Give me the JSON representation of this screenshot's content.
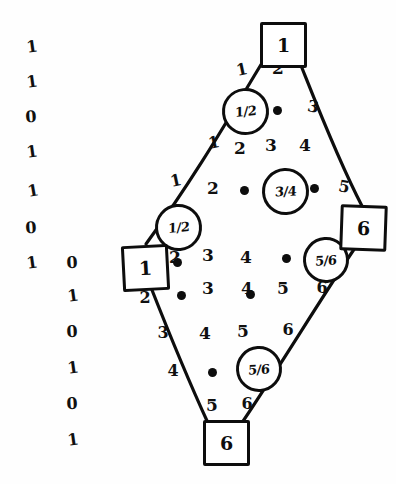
{
  "figure": {
    "type": "hand-drawn-lattice-diagram"
  },
  "binary_columns": [
    {
      "name": "outer-binary-column",
      "digits": [
        "1",
        "1",
        "0",
        "1",
        "1",
        "0",
        "1",
        "0",
        "1",
        "0",
        "1"
      ]
    },
    {
      "name": "inner-binary-column",
      "digits": [
        "0",
        "1",
        "0",
        "1",
        "0",
        "1"
      ]
    }
  ],
  "boxed_nodes": [
    {
      "name": "top-node",
      "label": "1"
    },
    {
      "name": "left-node",
      "label": "1"
    },
    {
      "name": "right-node",
      "label": "6"
    },
    {
      "name": "bottom-node",
      "label": "6"
    }
  ],
  "circled_nodes": [
    {
      "name": "circle-upper-left",
      "label": "1/2"
    },
    {
      "name": "circle-center",
      "label": "3/4"
    },
    {
      "name": "circle-lower-left",
      "label": "1/2"
    },
    {
      "name": "circle-upper-right",
      "label": "5/6"
    },
    {
      "name": "circle-lower-right",
      "label": "5/6"
    }
  ],
  "edge_labels": {
    "upper_left_edge": [
      "1",
      "1",
      "1"
    ],
    "upper_right_edge": [
      "3",
      "5"
    ],
    "lower_left_edge": [
      "2",
      "3",
      "4",
      "5"
    ],
    "lower_right_edge": [
      "6",
      "6",
      "6"
    ]
  },
  "interior_labels": {
    "row1": [
      "2"
    ],
    "row2": [
      "2",
      "3",
      "4"
    ],
    "row3": [
      "2",
      "3",
      "4"
    ],
    "row4": [
      "3",
      "4",
      "5"
    ],
    "row5": [
      "4",
      "5"
    ],
    "row6": [
      "5"
    ]
  },
  "colors": {
    "ink": "#0d0d0d",
    "paper": "#fefefe"
  },
  "tokens": [
    {
      "n": "bin-outer-0",
      "t": "1",
      "x": 32,
      "y": 47,
      "c": "bincol",
      "r": -8
    },
    {
      "n": "bin-outer-1",
      "t": "1",
      "x": 32,
      "y": 82,
      "c": "bincol",
      "r": -8
    },
    {
      "n": "bin-outer-2",
      "t": "0",
      "x": 31,
      "y": 117,
      "c": "bincol",
      "r": -4
    },
    {
      "n": "bin-outer-3",
      "t": "1",
      "x": 32,
      "y": 152,
      "c": "bincol",
      "r": -8
    },
    {
      "n": "bin-outer-4",
      "t": "1",
      "x": 33,
      "y": 191,
      "c": "bincol",
      "r": -10
    },
    {
      "n": "bin-outer-5",
      "t": "0",
      "x": 31,
      "y": 228,
      "c": "bincol",
      "r": -4
    },
    {
      "n": "bin-outer-6",
      "t": "1",
      "x": 32,
      "y": 263,
      "c": "bincol",
      "r": -8
    },
    {
      "n": "bin-inner-0",
      "t": "0",
      "x": 72,
      "y": 263,
      "c": "bincol",
      "r": -3
    },
    {
      "n": "bin-inner-1",
      "t": "1",
      "x": 73,
      "y": 296,
      "c": "bincol",
      "r": -8
    },
    {
      "n": "bin-inner-2",
      "t": "0",
      "x": 72,
      "y": 332,
      "c": "bincol",
      "r": -3
    },
    {
      "n": "bin-inner-3",
      "t": "1",
      "x": 73,
      "y": 368,
      "c": "bincol",
      "r": -8
    },
    {
      "n": "bin-inner-4",
      "t": "0",
      "x": 72,
      "y": 404,
      "c": "bincol",
      "r": -3
    },
    {
      "n": "bin-inner-5",
      "t": "1",
      "x": 73,
      "y": 440,
      "c": "bincol",
      "r": -8
    },
    {
      "n": "edge-ul-1",
      "t": "1",
      "x": 242,
      "y": 70,
      "c": "elabel",
      "r": -12
    },
    {
      "n": "edge-ul-2",
      "t": "1",
      "x": 214,
      "y": 143,
      "c": "elabel",
      "r": -12
    },
    {
      "n": "edge-ul-3",
      "t": "1",
      "x": 176,
      "y": 181,
      "c": "elabel",
      "r": -12
    },
    {
      "n": "interior-2a",
      "t": "2",
      "x": 278,
      "y": 68,
      "c": "ilabel",
      "r": 0
    },
    {
      "n": "interior-2b",
      "t": "2",
      "x": 240,
      "y": 148,
      "c": "ilabel",
      "r": 0
    },
    {
      "n": "interior-3b",
      "t": "3",
      "x": 271,
      "y": 145,
      "c": "ilabel",
      "r": 0
    },
    {
      "n": "interior-4b",
      "t": "4",
      "x": 305,
      "y": 145,
      "c": "ilabel",
      "r": 0
    },
    {
      "n": "interior-2c",
      "t": "2",
      "x": 213,
      "y": 188,
      "c": "ilabel",
      "r": 0
    },
    {
      "n": "interior-2d",
      "t": "2",
      "x": 175,
      "y": 257,
      "c": "ilabel",
      "r": 0
    },
    {
      "n": "interior-3d",
      "t": "3",
      "x": 208,
      "y": 255,
      "c": "ilabel",
      "r": 0
    },
    {
      "n": "interior-4d",
      "t": "4",
      "x": 246,
      "y": 257,
      "c": "ilabel",
      "r": 0
    },
    {
      "n": "interior-3e",
      "t": "3",
      "x": 208,
      "y": 288,
      "c": "ilabel",
      "r": 0
    },
    {
      "n": "interior-4e",
      "t": "4",
      "x": 247,
      "y": 288,
      "c": "ilabel",
      "r": 0
    },
    {
      "n": "interior-5e",
      "t": "5",
      "x": 283,
      "y": 288,
      "c": "ilabel",
      "r": 0
    },
    {
      "n": "interior-4f",
      "t": "4",
      "x": 205,
      "y": 333,
      "c": "ilabel",
      "r": 0
    },
    {
      "n": "interior-5f",
      "t": "5",
      "x": 243,
      "y": 331,
      "c": "ilabel",
      "r": 0
    },
    {
      "n": "interior-5g",
      "t": "5",
      "x": 212,
      "y": 405,
      "c": "ilabel",
      "r": 0
    },
    {
      "n": "edge-ur-3",
      "t": "3",
      "x": 313,
      "y": 107,
      "c": "elabel",
      "r": 10
    },
    {
      "n": "edge-ur-5",
      "t": "5",
      "x": 344,
      "y": 187,
      "c": "elabel",
      "r": 10
    },
    {
      "n": "edge-ll-2",
      "t": "2",
      "x": 145,
      "y": 298,
      "c": "elabel",
      "r": 0
    },
    {
      "n": "edge-ll-3",
      "t": "3",
      "x": 163,
      "y": 333,
      "c": "elabel",
      "r": 0
    },
    {
      "n": "edge-ll-4",
      "t": "4",
      "x": 173,
      "y": 371,
      "c": "elabel",
      "r": 0
    },
    {
      "n": "edge-lr-6",
      "t": "6",
      "x": 322,
      "y": 288,
      "c": "elabel",
      "r": 0
    },
    {
      "n": "edge-lr-6b",
      "t": "6",
      "x": 288,
      "y": 330,
      "c": "elabel",
      "r": 0
    },
    {
      "n": "edge-lr-6c",
      "t": "6",
      "x": 247,
      "y": 404,
      "c": "elabel",
      "r": 0
    }
  ],
  "dots": [
    {
      "n": "dot-r1",
      "x": 277,
      "y": 110
    },
    {
      "n": "dot-r3",
      "x": 244,
      "y": 190
    },
    {
      "n": "dot-r3b",
      "x": 314,
      "y": 188
    },
    {
      "n": "dot-r4",
      "x": 177,
      "y": 262
    },
    {
      "n": "dot-r5",
      "x": 181,
      "y": 295
    },
    {
      "n": "dot-r5b",
      "x": 250,
      "y": 294
    },
    {
      "n": "dot-r5c",
      "x": 286,
      "y": 258
    },
    {
      "n": "dot-r6",
      "x": 212,
      "y": 372
    }
  ]
}
